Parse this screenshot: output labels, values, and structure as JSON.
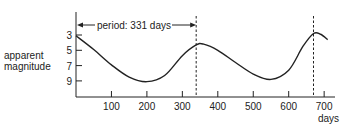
{
  "chart_data": {
    "type": "line",
    "title": "",
    "xlabel": "days",
    "ylabel": [
      "apparent",
      "magnitude"
    ],
    "xlim": [
      0,
      730
    ],
    "ylim": [
      1.5,
      10.5
    ],
    "y_inverted": true,
    "x_ticks": [
      100,
      200,
      300,
      400,
      500,
      600,
      700
    ],
    "y_ticks": [
      3,
      5,
      7,
      9
    ],
    "grid": false,
    "annotation": "period: 331 days",
    "dashed_lines_x": [
      339,
      670
    ],
    "series": [
      {
        "name": "light curve",
        "x": [
          0,
          50,
          100,
          150,
          200,
          250,
          300,
          339,
          360,
          400,
          450,
          500,
          550,
          600,
          640,
          670,
          690,
          710
        ],
        "y": [
          3.1,
          4.9,
          6.9,
          8.5,
          9.1,
          8.3,
          5.7,
          4.3,
          4.2,
          5.0,
          6.6,
          8.1,
          8.8,
          7.6,
          4.5,
          2.8,
          2.9,
          3.6
        ]
      }
    ]
  },
  "labels": {
    "ylabel_line1": "apparent",
    "ylabel_line2": "magnitude",
    "xlabel": "days",
    "annotation": "period: 331 days"
  }
}
